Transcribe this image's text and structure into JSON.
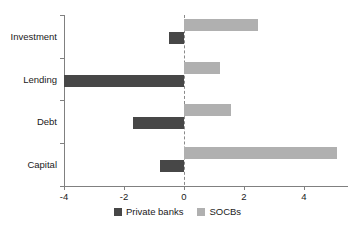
{
  "chart_data": {
    "type": "bar",
    "orientation": "horizontal",
    "title": "",
    "subtitle": "",
    "xlabel": "",
    "ylabel": "",
    "categories": [
      "Investment",
      "Lending",
      "Debt",
      "Capital"
    ],
    "series": [
      {
        "name": "Private banks",
        "color": "#474747",
        "values": [
          -0.5,
          -4.0,
          -1.7,
          -0.8
        ]
      },
      {
        "name": "SOCBs",
        "color": "#b0b0b0",
        "values": [
          2.45,
          1.2,
          1.55,
          5.1
        ]
      }
    ],
    "xlim": [
      -4.6,
      5.5
    ],
    "xticks": [
      -4,
      -2,
      0,
      2,
      4
    ],
    "xtick_labels": [
      "-4",
      "-2",
      "0",
      "2",
      "4"
    ],
    "grid": false,
    "zero_line": 0,
    "zero_line_style": "dashed",
    "legend_position": "bottom",
    "legend": [
      {
        "label": "Private banks",
        "color": "#474747"
      },
      {
        "label": "SOCBs",
        "color": "#b0b0b0"
      }
    ]
  },
  "axis": {
    "line_color": "#808080",
    "zero_line_color": "#8a8a8a"
  }
}
